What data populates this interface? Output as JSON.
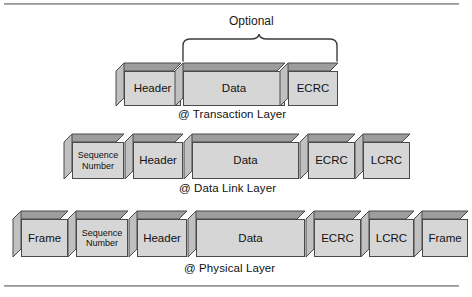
{
  "figure": {
    "annotation": {
      "label": "Optional"
    },
    "rows": [
      {
        "caption": "@ Transaction Layer",
        "segments": [
          {
            "label": "Header",
            "kind": "header"
          },
          {
            "label": "Data",
            "kind": "data"
          },
          {
            "label": "ECRC",
            "kind": "ecrc"
          }
        ]
      },
      {
        "caption": "@ Data Link Layer",
        "segments": [
          {
            "label": "Sequence\nNumber",
            "kind": "sequence-number"
          },
          {
            "label": "Header",
            "kind": "header"
          },
          {
            "label": "Data",
            "kind": "data"
          },
          {
            "label": "ECRC",
            "kind": "ecrc"
          },
          {
            "label": "LCRC",
            "kind": "lcrc"
          }
        ]
      },
      {
        "caption": "@ Physical Layer",
        "segments": [
          {
            "label": "Frame",
            "kind": "frame-start"
          },
          {
            "label": "Sequence\nNumber",
            "kind": "sequence-number"
          },
          {
            "label": "Header",
            "kind": "header"
          },
          {
            "label": "Data",
            "kind": "data"
          },
          {
            "label": "ECRC",
            "kind": "ecrc"
          },
          {
            "label": "LCRC",
            "kind": "lcrc"
          },
          {
            "label": "Frame",
            "kind": "frame-end"
          }
        ]
      }
    ]
  },
  "colors": {
    "box_front": "#d6d6d6",
    "box_top": "#9d9d9d",
    "box_side": "#c0c0c0",
    "outline": "#4a4a4a",
    "rule": "#8c8c8c",
    "text": "#111111"
  }
}
